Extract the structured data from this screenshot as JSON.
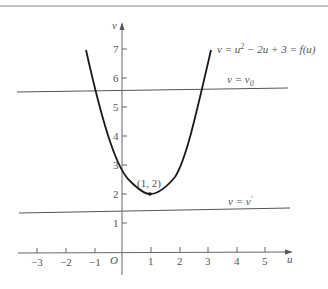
{
  "figure": {
    "curve_label": "v = u² − 2u + 3 = f(u)",
    "curve_label_parts": {
      "pre": "v = u",
      "sup": "2",
      "post": " − 2u + 3 = f(u)"
    },
    "line_top_label": "v = v₀",
    "line_top_parts": {
      "pre": "v = v",
      "sub": "0"
    },
    "line_bottom_label": "v = v′",
    "line_bottom_parts": {
      "pre": "v = v",
      "sup": "′"
    },
    "vertex_label": "(1, 2)",
    "origin_label": "O",
    "x_axis_label": "u",
    "y_axis_label": "v",
    "x_ticks": [
      "−3",
      "−2",
      "−1",
      "1",
      "2",
      "3",
      "4",
      "5"
    ],
    "y_ticks": [
      "1",
      "2",
      "3",
      "4",
      "5",
      "6",
      "7"
    ],
    "colors": {
      "curve": "#1a1a1a",
      "lines": "#555555",
      "text": "#555555"
    }
  }
}
